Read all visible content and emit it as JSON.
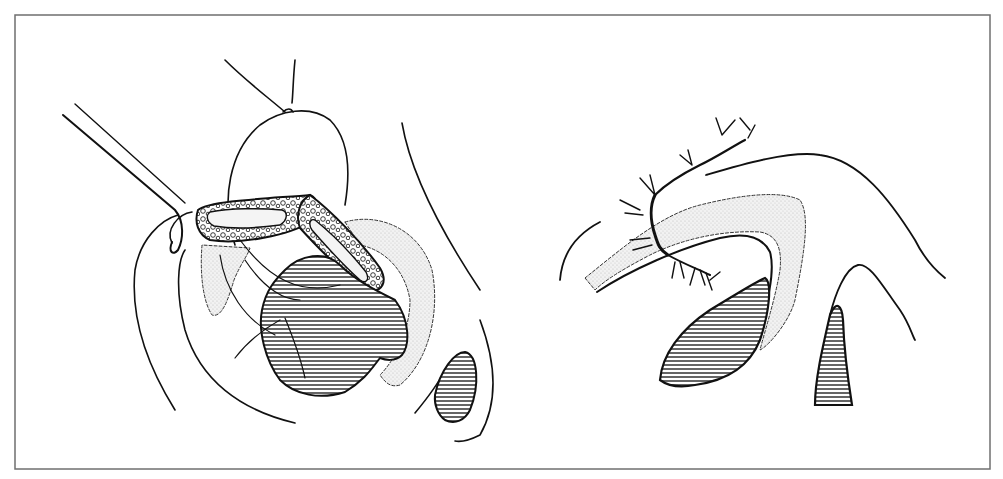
{
  "figure": {
    "type": "anatomical-surgical-line-illustration",
    "panels": [
      {
        "id": "left",
        "description": "surgical view with forceps retracting dissected tissue"
      },
      {
        "id": "right",
        "description": "sagittal schematic with branching vessels over curved stippled channel"
      }
    ],
    "colors": {
      "background": "#ffffff",
      "frame": "#6f6f6f",
      "ink": "#111111",
      "stipple": "#e4e4e4",
      "hatch": "#222222"
    }
  }
}
